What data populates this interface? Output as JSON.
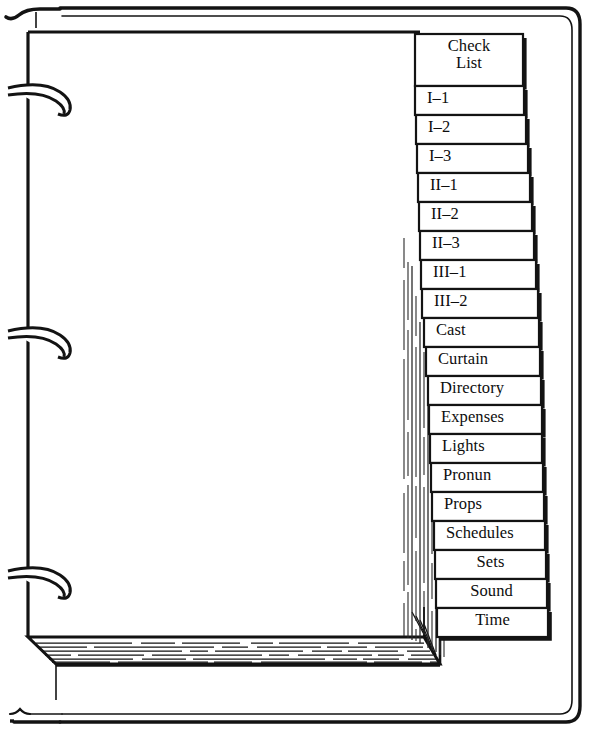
{
  "document": {
    "type": "ring-binder-with-index-tabs",
    "title": "Three-ring binder with labeled index divider tabs",
    "ink_color": "#111111",
    "paper_color": "#ffffff",
    "ring_count": 3
  },
  "binder": {
    "cover_label": "binder-cover",
    "spine_label": "binder-spine",
    "rings": [
      {
        "name": "ring-top"
      },
      {
        "name": "ring-middle"
      },
      {
        "name": "ring-bottom"
      }
    ],
    "page_stack_label": "page-stack-edge"
  },
  "tabs": [
    {
      "label": "Check\nList",
      "lines": [
        "Check",
        "List"
      ],
      "align": "center",
      "tall": true
    },
    {
      "label": "I–1",
      "lines": [
        "I–1"
      ],
      "align": "left"
    },
    {
      "label": "I–2",
      "lines": [
        "I–2"
      ],
      "align": "left"
    },
    {
      "label": "I–3",
      "lines": [
        "I–3"
      ],
      "align": "left"
    },
    {
      "label": "II–1",
      "lines": [
        "II–1"
      ],
      "align": "left"
    },
    {
      "label": "II–2",
      "lines": [
        "II–2"
      ],
      "align": "left"
    },
    {
      "label": "II–3",
      "lines": [
        "II–3"
      ],
      "align": "left"
    },
    {
      "label": "III–1",
      "lines": [
        "III–1"
      ],
      "align": "left"
    },
    {
      "label": "III–2",
      "lines": [
        "III–2"
      ],
      "align": "left"
    },
    {
      "label": "Cast",
      "lines": [
        "Cast"
      ],
      "align": "left"
    },
    {
      "label": "Curtain",
      "lines": [
        "Curtain"
      ],
      "align": "left"
    },
    {
      "label": "Directory",
      "lines": [
        "Directory"
      ],
      "align": "left"
    },
    {
      "label": "Expenses",
      "lines": [
        "Expenses"
      ],
      "align": "left"
    },
    {
      "label": "Lights",
      "lines": [
        "Lights"
      ],
      "align": "left"
    },
    {
      "label": "Pronun",
      "lines": [
        "Pronun"
      ],
      "align": "left"
    },
    {
      "label": "Props",
      "lines": [
        "Props"
      ],
      "align": "left"
    },
    {
      "label": "Schedules",
      "lines": [
        "Schedules"
      ],
      "align": "left"
    },
    {
      "label": "Sets",
      "lines": [
        "Sets"
      ],
      "align": "center"
    },
    {
      "label": "Sound",
      "lines": [
        "Sound"
      ],
      "align": "center"
    },
    {
      "label": "Time",
      "lines": [
        "Time"
      ],
      "align": "center"
    }
  ]
}
